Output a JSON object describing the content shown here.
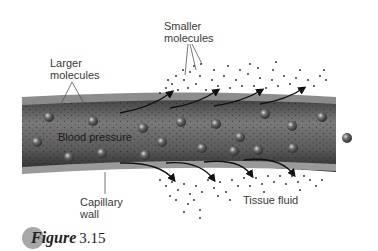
{
  "figure": {
    "caption_word": "Figure",
    "caption_number": "3.15"
  },
  "labels": {
    "smaller_molecules": "Smaller\nmolecules",
    "larger_molecules": "Larger\nmolecules",
    "blood_pressure": "Blood pressure",
    "capillary_wall": "Capillary\nwall",
    "tissue_fluid": "Tissue fluid"
  },
  "colors": {
    "vessel_dark": "#2f2f2f",
    "vessel_mid": "#6e6e6e",
    "vessel_wall": "#8c8c8c",
    "sphere": "#505050",
    "badge": "#a8a8a8",
    "text": "#3a3a3a"
  }
}
